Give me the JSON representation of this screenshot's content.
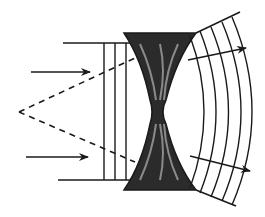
{
  "diagram": {
    "type": "diverging-lens-wavefront",
    "colors": {
      "ink": "#1a1a1a",
      "lens_fill": "#2b2b2b",
      "lens_highlight": "#8a8a8a",
      "background": "#ffffff"
    },
    "virtual_focus": {
      "x": 18,
      "y": 112
    },
    "incident_arrows": 2,
    "plane_wavefronts": 3,
    "emerging_wavefronts": 5,
    "emerging_arrows": 2
  }
}
